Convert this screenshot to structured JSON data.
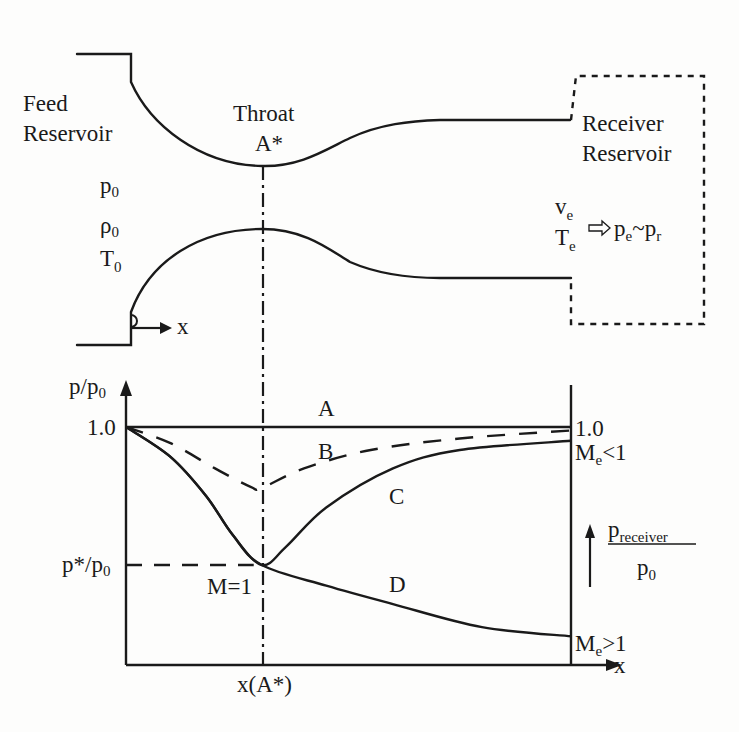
{
  "nozzle": {
    "feed_reservoir": {
      "line1": "Feed",
      "line2": "Reservoir"
    },
    "throat": {
      "line1": "Throat",
      "line2": "A*"
    },
    "receiver_reservoir": {
      "line1": "Receiver",
      "line2": "Reservoir"
    },
    "stagnation": {
      "p": {
        "base": "p",
        "sub": "0"
      },
      "rho": {
        "base": "ρ",
        "sub": "0"
      },
      "T": {
        "base": "T",
        "sub": "0"
      }
    },
    "exit": {
      "v": {
        "base": "v",
        "sub": "e"
      },
      "T": {
        "base": "T",
        "sub": "e"
      },
      "pe": {
        "base": "p",
        "sub": "e"
      },
      "tilde": "~",
      "pr": {
        "base": "p",
        "sub": "r"
      }
    },
    "x_label": "x"
  },
  "chart_data": {
    "type": "line",
    "title": "",
    "xlabel": "x",
    "ylabel": "p/p0",
    "ylabel_parts": {
      "base": "p/p",
      "sub": "0"
    },
    "xlim": [
      0,
      1
    ],
    "ylim": [
      0,
      1.15
    ],
    "throat_x": 0.305,
    "x_tick_labels": [
      {
        "x": 0.305,
        "label": "x(A*)"
      }
    ],
    "y_tick_labels": [
      {
        "y": 1.0,
        "label": "1.0"
      },
      {
        "y": 0.4,
        "label": "p*/p0",
        "parts": {
          "base": "p*/p",
          "sub": "0"
        }
      }
    ],
    "right_labels": {
      "top": "1.0",
      "subsonic": {
        "base": "M",
        "sub": "e",
        "rest": "<1"
      },
      "supersonic": {
        "base": "M",
        "sub": "e",
        "rest": ">1"
      }
    },
    "sonic_label": "M=1",
    "receiver_arrow": {
      "numerator": {
        "base": "p",
        "sub": "receiver"
      },
      "denominator": {
        "base": "p",
        "sub": "0"
      }
    },
    "series": [
      {
        "name": "A",
        "style": "solid",
        "points": [
          [
            0,
            1.0
          ],
          [
            1,
            1.0
          ]
        ]
      },
      {
        "name": "B",
        "style": "dashed",
        "points": [
          [
            0,
            1.0
          ],
          [
            0.1,
            0.93
          ],
          [
            0.2,
            0.82
          ],
          [
            0.28,
            0.74
          ],
          [
            0.305,
            0.735
          ],
          [
            0.4,
            0.82
          ],
          [
            0.55,
            0.9
          ],
          [
            0.75,
            0.95
          ],
          [
            1,
            0.985
          ]
        ]
      },
      {
        "name": "C",
        "style": "solid",
        "points": [
          [
            0,
            1.0
          ],
          [
            0.1,
            0.87
          ],
          [
            0.18,
            0.7
          ],
          [
            0.24,
            0.53
          ],
          [
            0.305,
            0.4
          ],
          [
            0.36,
            0.48
          ],
          [
            0.45,
            0.65
          ],
          [
            0.6,
            0.82
          ],
          [
            0.75,
            0.9
          ],
          [
            1,
            0.94
          ]
        ]
      },
      {
        "name": "D",
        "style": "solid",
        "points": [
          [
            0,
            1.0
          ],
          [
            0.1,
            0.87
          ],
          [
            0.18,
            0.7
          ],
          [
            0.24,
            0.53
          ],
          [
            0.305,
            0.4
          ],
          [
            0.45,
            0.31
          ],
          [
            0.6,
            0.23
          ],
          [
            0.8,
            0.13
          ],
          [
            1,
            0.09
          ]
        ]
      }
    ],
    "curve_labels": [
      {
        "name": "A",
        "label": "A"
      },
      {
        "name": "B",
        "label": "B"
      },
      {
        "name": "C",
        "label": "C"
      },
      {
        "name": "D",
        "label": "D"
      }
    ]
  }
}
